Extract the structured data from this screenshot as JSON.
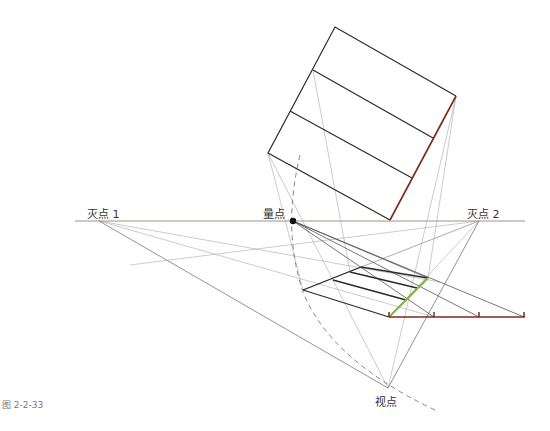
{
  "labels": {
    "vp1": "灭点 1",
    "vp2": "灭点 2",
    "measure_point": "量点",
    "viewpoint": "视点"
  },
  "caption": "图 2-2-33",
  "colors": {
    "outline": "#2a2a2a",
    "construction": "#9a9a9a",
    "horizon": "#8a8a7a",
    "measure_line": "#7a2a1a",
    "green_edge": "#7fb34a",
    "dashed_arc": "#777777"
  },
  "geometry": {
    "horizon": {
      "x1": 75,
      "x2": 525,
      "y": 221
    },
    "vp1": [
      99,
      221
    ],
    "vp2": [
      479,
      221
    ],
    "measure_point": [
      293,
      221
    ],
    "viewpoint": [
      388,
      388
    ],
    "square": [
      [
        335,
        27
      ],
      [
        456,
        96
      ],
      [
        390,
        220
      ],
      [
        268,
        153
      ]
    ],
    "square_dividers": [
      [
        [
          313,
          70
        ],
        [
          433,
          138
        ]
      ],
      [
        [
          290,
          111
        ],
        [
          412,
          178
        ]
      ]
    ],
    "floor_plan": [
      [
        303,
        290
      ],
      [
        361,
        267
      ],
      [
        428,
        278
      ],
      [
        389,
        317
      ]
    ],
    "measuring_line": {
      "x1": 389,
      "x2": 525,
      "y": 317,
      "ticks": [
        389,
        434,
        479,
        524
      ]
    }
  }
}
